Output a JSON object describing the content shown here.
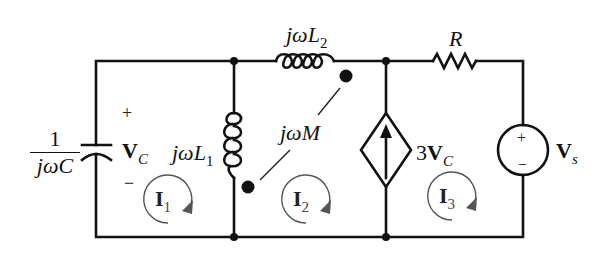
{
  "diagram": {
    "type": "circuit-schematic"
  },
  "components": {
    "capacitor": {
      "label_numerator": "1",
      "label_denominator": "jωC"
    },
    "capacitor_voltage": {
      "plus": "+",
      "minus": "−",
      "symbol": "V",
      "subscript": "C"
    },
    "inductor_L1": {
      "prefix": "jω",
      "symbol": "L",
      "subscript": "1"
    },
    "inductor_L2": {
      "prefix": "jω",
      "symbol": "L",
      "subscript": "2"
    },
    "mutual_inductance": {
      "label": "jωM"
    },
    "dependent_source": {
      "coefficient": "3",
      "symbol": "V",
      "subscript": "C",
      "arrow_direction": "up"
    },
    "resistor": {
      "label": "R"
    },
    "voltage_source": {
      "plus": "+",
      "minus": "−",
      "symbol": "V",
      "subscript": "s"
    }
  },
  "mesh_currents": [
    {
      "symbol": "I",
      "subscript": "1",
      "direction": "clockwise"
    },
    {
      "symbol": "I",
      "subscript": "2",
      "direction": "clockwise"
    },
    {
      "symbol": "I",
      "subscript": "3",
      "direction": "clockwise"
    }
  ],
  "colors": {
    "wire": "#111111",
    "background": "#ffffff",
    "loop_arrow": "#555555"
  }
}
